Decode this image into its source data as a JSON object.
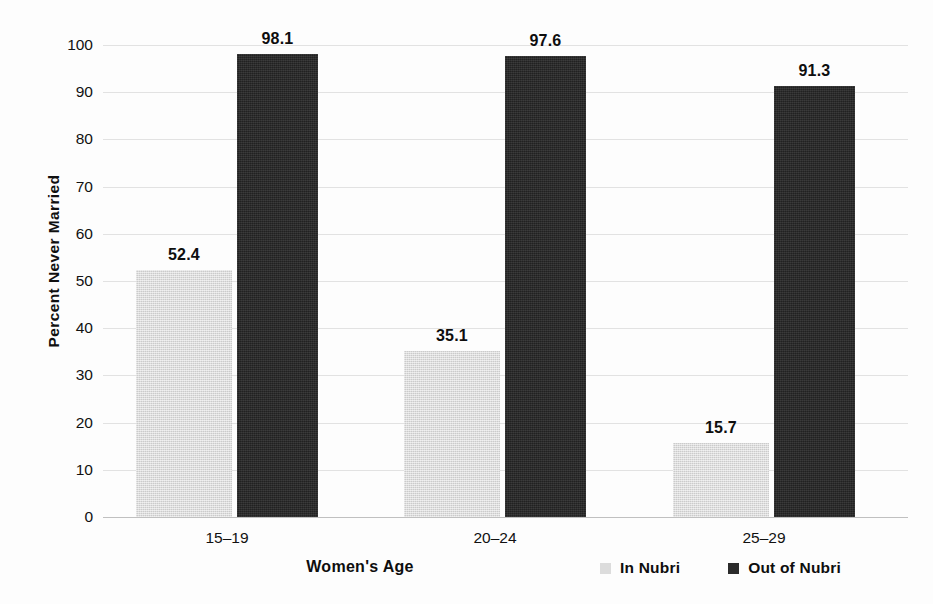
{
  "chart_data": {
    "type": "bar",
    "title": "",
    "subtitle": "",
    "xlabel": "Women's Age",
    "ylabel": "Percent Never Married",
    "categories": [
      "15–19",
      "20–24",
      "25–29"
    ],
    "series": [
      {
        "name": "In Nubri",
        "values": [
          52.4,
          35.1,
          15.7
        ],
        "color": "#d9d9d9"
      },
      {
        "name": "Out of Nubri",
        "values": [
          98.1,
          97.6,
          91.3
        ],
        "color": "#282828"
      }
    ],
    "ylim": [
      0,
      100
    ],
    "yticks": [
      0,
      10,
      20,
      30,
      40,
      50,
      60,
      70,
      80,
      90,
      100
    ],
    "ytick_labels": [
      "0",
      "10",
      "20",
      "30",
      "40",
      "50",
      "60",
      "70",
      "80",
      "90",
      "100"
    ],
    "grid": "horizontal",
    "grid_color": "#d7d7d7",
    "legend_position": "bottom-right",
    "data_labels": true,
    "data_label_text": [
      [
        "52.4",
        "35.1",
        "15.7"
      ],
      [
        "98.1",
        "97.6",
        "91.3"
      ]
    ],
    "background": "#ffffff"
  },
  "axes": {
    "y_title": "Percent Never Married",
    "x_title": "Women's Age"
  },
  "legend": {
    "items": [
      {
        "label": "In Nubri",
        "swatch": "light"
      },
      {
        "label": "Out of Nubri",
        "swatch": "dark"
      }
    ]
  }
}
